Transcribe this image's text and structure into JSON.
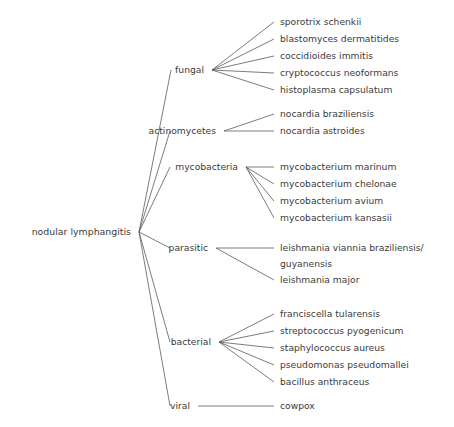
{
  "diagram": {
    "title": "nodular lymphangitis",
    "type": "tree",
    "orientation": "left-to-right",
    "line_color": "#5a5a5a",
    "text_color": "#3b3b3b",
    "background_color": "#ffffff"
  },
  "root": {
    "label": "nodular lymphangitis",
    "x": 131,
    "y": 232,
    "fan_x": 139
  },
  "groups": [
    {
      "id": "fungal",
      "label": "fungal",
      "label_x": 204,
      "label_y": 70,
      "fan_x": 212,
      "stub_x": 171,
      "leaf_text_x": 280,
      "leaves": [
        {
          "label": "sporotrix schenkii",
          "y": 22
        },
        {
          "label": "blastomyces dermatitides",
          "y": 39
        },
        {
          "label": "coccidioides immitis",
          "y": 56
        },
        {
          "label": "cryptococcus neoformans",
          "y": 73
        },
        {
          "label": "histoplasma capsulatum",
          "y": 90
        }
      ]
    },
    {
      "id": "actinomycetes",
      "label": "actinomycetes",
      "label_x": 216,
      "label_y": 131,
      "fan_x": 224,
      "stub_x": 170,
      "leaf_text_x": 280,
      "leaves": [
        {
          "label": "nocardia braziliensis",
          "y": 114
        },
        {
          "label": "nocardia astroides",
          "y": 131
        }
      ]
    },
    {
      "id": "mycobacteria",
      "label": "mycobacteria",
      "label_x": 238,
      "label_y": 167,
      "fan_x": 246,
      "stub_x": 170,
      "leaf_text_x": 280,
      "leaves": [
        {
          "label": "mycobacterium marinum",
          "y": 167
        },
        {
          "label": "mycobacterium chelonae",
          "y": 184
        },
        {
          "label": "mycobacterium avium",
          "y": 201
        },
        {
          "label": "mycobacterium kansasii",
          "y": 218
        }
      ]
    },
    {
      "id": "parasitic",
      "label": "parasitic",
      "label_x": 208,
      "label_y": 248,
      "fan_x": 216,
      "stub_x": 170,
      "leaf_text_x": 280,
      "leaves": [
        {
          "label": "leishmania viannia braziliensis/",
          "y": 248,
          "continuation": "guyanensis",
          "continuation_y": 264
        },
        {
          "label": "leishmania major",
          "y": 280
        }
      ]
    },
    {
      "id": "bacterial",
      "label": "bacterial",
      "label_x": 211,
      "label_y": 342,
      "fan_x": 219,
      "stub_x": 170,
      "leaf_text_x": 280,
      "leaves": [
        {
          "label": "franciscella tularensis",
          "y": 314
        },
        {
          "label": "streptococcus pyogenicum",
          "y": 331
        },
        {
          "label": "staphylococcus aureus",
          "y": 348
        },
        {
          "label": "pseudomonas pseudomallei",
          "y": 365
        },
        {
          "label": "bacillus anthraceus",
          "y": 382
        }
      ]
    },
    {
      "id": "viral",
      "label": "viral",
      "label_x": 190,
      "label_y": 406,
      "fan_x": 198,
      "stub_x": 170,
      "leaf_text_x": 280,
      "leaves": [
        {
          "label": "cowpox",
          "y": 406
        }
      ]
    }
  ]
}
